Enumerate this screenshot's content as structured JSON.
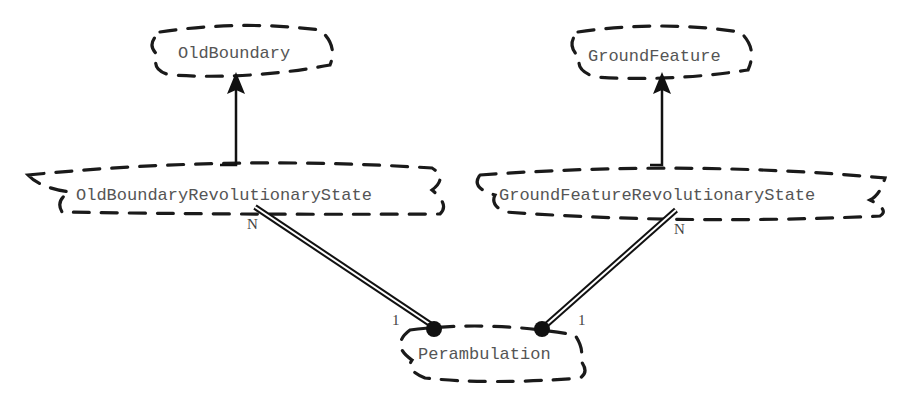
{
  "diagram": {
    "type": "class-relationship",
    "style": "hand-drawn dashed cloud nodes",
    "nodes": [
      {
        "id": "old_boundary",
        "label": "OldBoundary"
      },
      {
        "id": "ground_feature",
        "label": "GroundFeature"
      },
      {
        "id": "old_boundary_rev_state",
        "label": "OldBoundaryRevolutionaryState"
      },
      {
        "id": "ground_feature_rev_state",
        "label": "GroundFeatureRevolutionaryState"
      },
      {
        "id": "perambulation",
        "label": "Perambulation"
      }
    ],
    "edges": [
      {
        "from": "old_boundary_rev_state",
        "to": "old_boundary",
        "kind": "generalization-arrow"
      },
      {
        "from": "ground_feature_rev_state",
        "to": "ground_feature",
        "kind": "generalization-arrow"
      },
      {
        "from": "old_boundary_rev_state",
        "to": "perambulation",
        "kind": "aggregation-double-line",
        "source_multiplicity": "N",
        "target_multiplicity": "1"
      },
      {
        "from": "ground_feature_rev_state",
        "to": "perambulation",
        "kind": "aggregation-double-line",
        "source_multiplicity": "N",
        "target_multiplicity": "1"
      }
    ],
    "colors": {
      "stroke": "#1a1a1a",
      "text": "#555555",
      "background": "#ffffff"
    }
  }
}
